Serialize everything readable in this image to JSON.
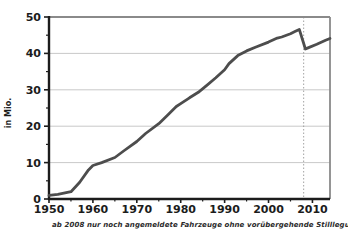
{
  "figure": {
    "footnote": "ab 2008  nur noch angemeldete Fahrzeuge ohne vorübergehende Stilllegungen"
  },
  "chart_data": {
    "type": "line",
    "title": "",
    "xlabel": "",
    "ylabel": "in Mio.",
    "xlim": [
      1950,
      2014
    ],
    "ylim": [
      0,
      50
    ],
    "x_ticks": [
      1950,
      1960,
      1970,
      1980,
      1990,
      2000,
      2010
    ],
    "y_ticks": [
      0,
      10,
      20,
      30,
      40,
      50
    ],
    "minor_tick_interval": 5,
    "grid": "horizontal",
    "legend": "none",
    "reference_line": {
      "x": 2008,
      "style": "dotted"
    },
    "series": [
      {
        "name": "",
        "points": [
          [
            1950,
            1.0
          ],
          [
            1952,
            1.3
          ],
          [
            1955,
            2.0
          ],
          [
            1957,
            4.6
          ],
          [
            1959,
            8.0
          ],
          [
            1960,
            9.2
          ],
          [
            1962,
            10.0
          ],
          [
            1965,
            11.4
          ],
          [
            1967,
            13.2
          ],
          [
            1970,
            15.8
          ],
          [
            1972,
            18.0
          ],
          [
            1975,
            20.7
          ],
          [
            1977,
            23.0
          ],
          [
            1979,
            25.4
          ],
          [
            1980,
            26.2
          ],
          [
            1982,
            27.8
          ],
          [
            1984,
            29.3
          ],
          [
            1986,
            31.3
          ],
          [
            1988,
            33.3
          ],
          [
            1990,
            35.5
          ],
          [
            1991,
            37.2
          ],
          [
            1993,
            39.4
          ],
          [
            1995,
            40.7
          ],
          [
            1997,
            41.7
          ],
          [
            2000,
            43.1
          ],
          [
            2002,
            44.2
          ],
          [
            2003,
            44.5
          ],
          [
            2005,
            45.4
          ],
          [
            2006,
            46.0
          ],
          [
            2007,
            46.6
          ],
          [
            2008.4,
            41.2
          ],
          [
            2009,
            41.5
          ],
          [
            2011,
            42.5
          ],
          [
            2013,
            43.6
          ],
          [
            2014,
            44.1
          ]
        ]
      }
    ],
    "colors": {
      "line": "#4d4d4d",
      "grid": "#bababa",
      "axis": "#1c1c1c",
      "frame": "#8a8a8a",
      "reference": "#999999",
      "text": "#1c1c1c"
    }
  }
}
